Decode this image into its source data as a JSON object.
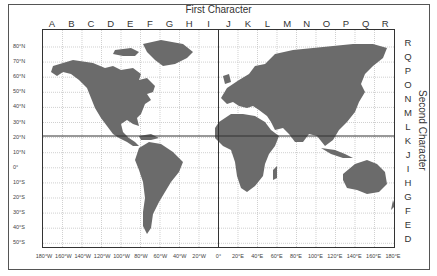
{
  "map": {
    "title_top": "First Character",
    "title_right": "Second Character",
    "columns": [
      "A",
      "B",
      "C",
      "D",
      "E",
      "F",
      "G",
      "H",
      "I",
      "J",
      "K",
      "L",
      "M",
      "N",
      "O",
      "P",
      "Q",
      "R"
    ],
    "rows": [
      "R",
      "Q",
      "P",
      "O",
      "N",
      "M",
      "L",
      "K",
      "J",
      "I",
      "H",
      "G",
      "F",
      "E",
      "D"
    ],
    "latitudes": [
      "80°N",
      "70°N",
      "60°N",
      "50°N",
      "40°N",
      "30°N",
      "20°N",
      "10°N",
      "0°",
      "10°S",
      "20°S",
      "30°S",
      "40°S",
      "50°S"
    ],
    "longitudes": [
      "180°W",
      "160°W",
      "140°W",
      "120°W",
      "100°W",
      "80°W",
      "60°W",
      "40°W",
      "20°W",
      "0°",
      "20°E",
      "40°E",
      "60°E",
      "80°E",
      "100°E",
      "120°E",
      "140°E",
      "160°E",
      "180°E"
    ],
    "colors": {
      "land": "#6b6b6b",
      "grid": "#bbbbbb",
      "axis": "#333333",
      "background": "#ffffff"
    }
  }
}
